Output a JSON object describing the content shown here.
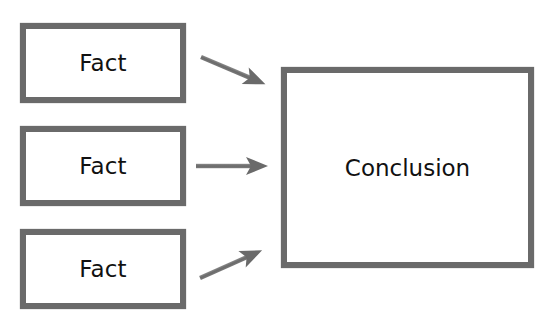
{
  "diagram": {
    "facts": [
      {
        "label": "Fact"
      },
      {
        "label": "Fact"
      },
      {
        "label": "Fact"
      }
    ],
    "conclusion": {
      "label": "Conclusion"
    },
    "edges": [
      {
        "from": "fact-1",
        "to": "conclusion"
      },
      {
        "from": "fact-2",
        "to": "conclusion"
      },
      {
        "from": "fact-3",
        "to": "conclusion"
      }
    ],
    "colors": {
      "border": "#6a6a6a",
      "arrow": "#6e6e6e",
      "text": "#111111",
      "background": "#ffffff"
    }
  }
}
